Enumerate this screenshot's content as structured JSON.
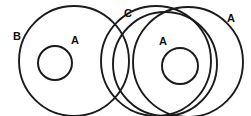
{
  "diagram": {
    "kind": "venn-diagram",
    "background_color": "#ffffff",
    "stroke_color": "#1b1b1b",
    "labels": [
      {
        "id": "label-b-outer-left",
        "text": "B",
        "x": 13,
        "y": 31
      },
      {
        "id": "label-a-inner-left",
        "text": "A",
        "x": 71,
        "y": 35
      },
      {
        "id": "label-c-middle",
        "text": "C",
        "x": 124,
        "y": 8
      },
      {
        "id": "label-a-inner-right",
        "text": "A",
        "x": 159,
        "y": 36
      },
      {
        "id": "label-a-outer-right",
        "text": "A",
        "x": 227,
        "y": 13
      }
    ],
    "circles": [
      {
        "id": "circle-b-outer-left",
        "set": "B",
        "cx": 74,
        "cy": 61,
        "r": 55
      },
      {
        "id": "circle-a-inner-left",
        "set": "A",
        "cx": 55,
        "cy": 63,
        "r": 17
      },
      {
        "id": "circle-c-middle",
        "set": "C",
        "cx": 156,
        "cy": 61,
        "r": 55
      },
      {
        "id": "circle-mid-right",
        "set": "",
        "cx": 165,
        "cy": 64,
        "r": 52
      },
      {
        "id": "circle-a-outer-right",
        "set": "A",
        "cx": 188,
        "cy": 62,
        "r": 55
      },
      {
        "id": "circle-a-inner-right",
        "set": "A",
        "cx": 180,
        "cy": 66,
        "r": 18
      }
    ]
  }
}
